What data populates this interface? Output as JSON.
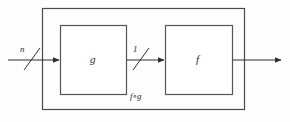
{
  "diagram": {
    "type": "block-diagram",
    "outer_block": {
      "label": "f∘g",
      "name": "composition-block"
    },
    "blocks": [
      {
        "id": "g",
        "label": "g",
        "name": "block-g"
      },
      {
        "id": "f",
        "label": "f",
        "name": "block-f"
      }
    ],
    "signals": [
      {
        "id": "input",
        "label": "n",
        "name": "input-signal",
        "bus": true
      },
      {
        "id": "intermediate",
        "label": "1",
        "name": "intermediate-signal",
        "bus": true
      },
      {
        "id": "output",
        "label": "",
        "name": "output-signal",
        "bus": false
      }
    ],
    "colors": {
      "stroke": "#3a3a3a",
      "box_stroke": "#555555",
      "text": "#2b2b2b",
      "background": "#fdfdfd"
    }
  }
}
